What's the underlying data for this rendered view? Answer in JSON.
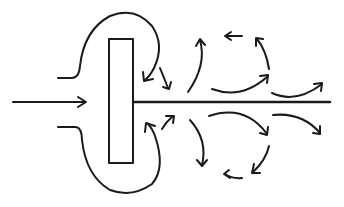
{
  "diagram": {
    "title": "",
    "colors": {
      "ink": "#1a1a1a",
      "background": "#ffffff"
    },
    "elements": [
      {
        "id": "inflow-arrow",
        "type": "arrow",
        "direction": "right"
      },
      {
        "id": "plate",
        "type": "rectangle"
      },
      {
        "id": "shaft",
        "type": "line",
        "direction": "right"
      },
      {
        "id": "upper-loop",
        "type": "curve-arrow"
      },
      {
        "id": "lower-loop",
        "type": "curve-arrow"
      },
      {
        "id": "wake-vortices-upper",
        "type": "curve-arrow-group",
        "count": 6
      },
      {
        "id": "wake-vortices-lower",
        "type": "curve-arrow-group",
        "count": 6
      }
    ]
  }
}
